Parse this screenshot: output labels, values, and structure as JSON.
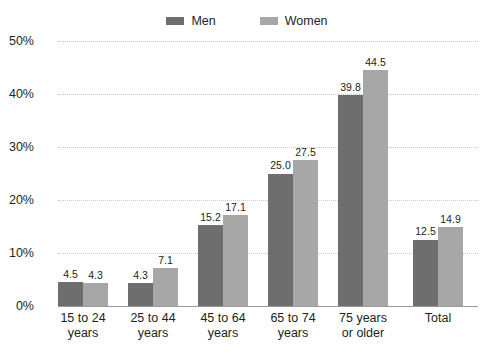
{
  "chart_data": {
    "type": "bar",
    "title": "",
    "subtitle": "",
    "xlabel": "",
    "ylabel": "",
    "ylim": [
      0,
      50
    ],
    "ytick_values": [
      0,
      10,
      20,
      30,
      40,
      50
    ],
    "ytick_labels": [
      "0%",
      "10%",
      "20%",
      "30%",
      "40%",
      "50%"
    ],
    "grid": true,
    "legend_position": "top-center",
    "value_label_format": "one-decimal",
    "categories": [
      "15 to 24 years",
      "25 to 44 years",
      "45 to 64 years",
      "65 to 74 years",
      "75 years or older",
      "Total"
    ],
    "category_lines": [
      [
        "15 to 24",
        "years"
      ],
      [
        "25 to 44",
        "years"
      ],
      [
        "45 to 64",
        "years"
      ],
      [
        "65 to 74",
        "years"
      ],
      [
        "75 years",
        "or older"
      ],
      [
        "Total"
      ]
    ],
    "series": [
      {
        "name": "Men",
        "color": "#6e6e6e",
        "values": [
          4.5,
          4.3,
          15.2,
          25.0,
          39.8,
          12.5
        ],
        "value_labels": [
          "4.5",
          "4.3",
          "15.2",
          "25.0",
          "39.8",
          "12.5"
        ]
      },
      {
        "name": "Women",
        "color": "#a7a7a7",
        "values": [
          4.3,
          7.1,
          17.1,
          27.5,
          44.5,
          14.9
        ],
        "value_labels": [
          "4.3",
          "7.1",
          "17.1",
          "27.5",
          "44.5",
          "14.9"
        ]
      }
    ]
  },
  "legend": {
    "entries": [
      {
        "label": "Men",
        "color": "#6e6e6e"
      },
      {
        "label": "Women",
        "color": "#a7a7a7"
      }
    ]
  },
  "axis": {
    "gridline_color": "#c9c9c9",
    "baseline_color": "#9a9a9a"
  }
}
